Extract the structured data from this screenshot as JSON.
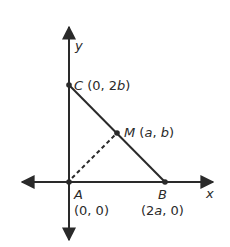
{
  "diagram": {
    "type": "coordinate-geometry",
    "axes": {
      "x_label": "x",
      "y_label": "y"
    },
    "points": [
      {
        "name": "A",
        "coords": "(0, 0)"
      },
      {
        "name": "B",
        "coords": "(2a, 0)"
      },
      {
        "name": "C",
        "coords": "(0, 2b)"
      },
      {
        "name": "M",
        "coords": "(a, b)"
      }
    ],
    "segments": [
      {
        "from": "C",
        "to": "B",
        "style": "solid"
      },
      {
        "from": "A",
        "to": "M",
        "style": "dashed"
      }
    ],
    "labels": {
      "y": "y",
      "x": "x",
      "C_name": "C",
      "C_coords": " (0, 2",
      "C_var": "b",
      "C_close": ")",
      "M_name": "M",
      "M_open": " (",
      "M_a": "a",
      "M_comma": ", ",
      "M_b": "b",
      "M_close": ")",
      "A_name": "A",
      "A_coords": "(0, 0)",
      "B_name": "B",
      "B_open": "(2",
      "B_a": "a",
      "B_close": ", 0)"
    },
    "colors": {
      "line": "#2a2a2a",
      "background": "#ffffff"
    }
  }
}
